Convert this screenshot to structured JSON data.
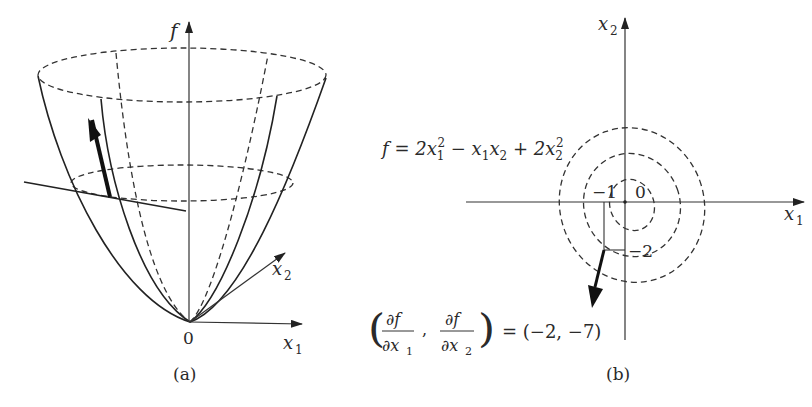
{
  "figure": {
    "panel_a": {
      "caption": "(a)",
      "axis_f_label": "f",
      "axis_x1_label": "x",
      "axis_x1_sub": "1",
      "axis_x2_label": "x",
      "axis_x2_sub": "2",
      "origin_label": "0",
      "description": "3D paraboloid surface f(x1,x2) with dashed level ellipses, a tangent line and gradient arrow"
    },
    "panel_b": {
      "caption": "(b)",
      "axis_x1_label": "x",
      "axis_x1_sub": "1",
      "axis_x2_label": "x",
      "axis_x2_sub": "2",
      "function_lhs": "f = 2x",
      "function_terms": [
        "f = 2x",
        "1",
        "2",
        " − x",
        "1",
        "x",
        "2",
        " + 2x",
        "2",
        "2"
      ],
      "tick_minus1": "−1",
      "tick_0": "0",
      "tick_minus2": "−2",
      "gradient_lhs_partial_num": "∂f",
      "gradient_lhs_partial_den1": "∂x",
      "gradient_lhs_partial_den1_sub": "1",
      "gradient_lhs_partial_den2": "∂x",
      "gradient_lhs_partial_den2_sub": "2",
      "gradient_rhs": "= (−2, −7)",
      "gradient_value": [
        -2,
        -7
      ],
      "description": "Contour plot of f = 2x1² − x1x2 + 2x2² with dashed level curves and gradient vector at (−1, −2)"
    }
  }
}
